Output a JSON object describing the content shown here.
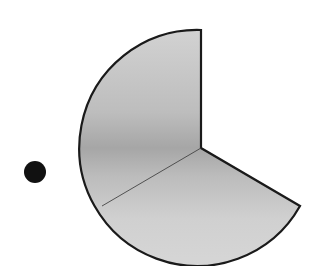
{
  "diagram": {
    "type": "circular-sector",
    "center": [
      201,
      148
    ],
    "radius": 117,
    "sector": {
      "start_angle_deg": -90,
      "end_angle_deg": 30,
      "missing_wedge_note": "sector spans from top going counter-clockwise around left and bottom to 30° below horizontal on right",
      "fill_colors": {
        "dark": "#a8a8a8",
        "light": "#d4d4d4"
      },
      "stroke": "#1a1a1a"
    },
    "divider_line": {
      "from": [
        201,
        148
      ],
      "to": [
        102,
        206
      ]
    },
    "dot": {
      "center": [
        35,
        172
      ],
      "radius": 11,
      "color": "#111111"
    }
  }
}
